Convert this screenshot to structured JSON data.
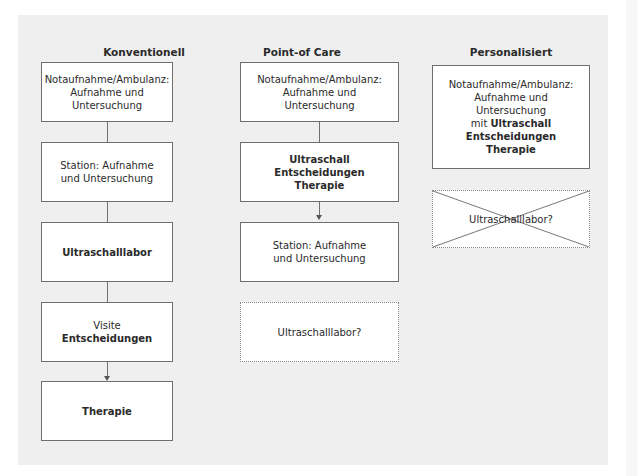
{
  "columns": [
    {
      "title": "Konventionell",
      "boxes": [
        {
          "lines": [
            "Notaufnahme/Ambulanz:",
            "Aufnahme und",
            "Untersuchung"
          ]
        },
        {
          "lines": [
            "Station: Aufnahme",
            "und Untersuchung"
          ]
        },
        {
          "bold": "Ultraschalllabor"
        },
        {
          "normal": "Visite",
          "bold": "Entscheidungen"
        },
        {
          "bold": "Therapie"
        }
      ]
    },
    {
      "title": "Point-of Care",
      "boxes": [
        {
          "lines": [
            "Notaufnahme/Ambulanz:",
            "Aufnahme und",
            "Untersuchung"
          ]
        },
        {
          "bold_lines": [
            "Ultraschall",
            "Entscheidungen",
            "Therapie"
          ]
        },
        {
          "lines": [
            "Station: Aufnahme",
            "und Untersuchung"
          ]
        },
        {
          "text": "Ultraschalllabor?",
          "style": "dotted"
        }
      ]
    },
    {
      "title": "Personalisiert",
      "boxes": [
        {
          "lines": [
            "Notaufnahme/Ambulanz:",
            "Aufnahme und",
            "Untersuchung"
          ],
          "prefix": "mit",
          "bold_inline": "Ultraschall",
          "bold_lines": [
            "Entscheidungen",
            "Therapie"
          ]
        },
        {
          "text": "Ultraschalllabor?",
          "style": "dotted-crossed-out"
        }
      ]
    }
  ]
}
